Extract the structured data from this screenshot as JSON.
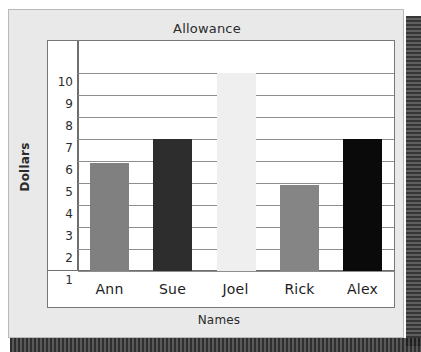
{
  "chart_data": {
    "type": "bar",
    "title": "Allowance",
    "xlabel": "Names",
    "ylabel": "Dollars",
    "categories": [
      "Ann",
      "Sue",
      "Joel",
      "Rick",
      "Alex"
    ],
    "values": [
      5.9,
      7,
      10,
      4.9,
      7
    ],
    "ylim": [
      1,
      10
    ],
    "yticks": [
      10,
      9,
      8,
      7,
      6,
      5,
      4,
      3,
      2,
      1
    ],
    "grid": true,
    "legend": "none",
    "bar_colors": [
      "#808080",
      "#2d2d2d",
      "#efefef",
      "#858585",
      "#0a0a0a"
    ]
  },
  "style": {
    "panel_background": "#e9e9e9",
    "plot_background": "#ffffff",
    "panel_border": "#b9b9b9",
    "axis_color": "#6f6f6f",
    "gridline_color": "#8d8d8d",
    "text_color": "#2b2b2b"
  }
}
